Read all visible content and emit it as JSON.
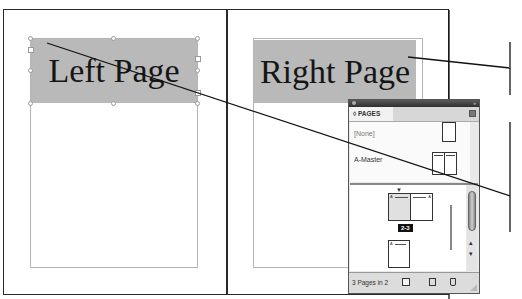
{
  "document": {
    "left_page": {
      "text_frame_label": "Left Page"
    },
    "right_page": {
      "text_frame_label": "Right Page"
    }
  },
  "pages_panel": {
    "tab_label": "◊ PAGES",
    "menu_icon": "panel-menu-icon",
    "masters": [
      {
        "label": "[None]"
      },
      {
        "label": "A-Master"
      }
    ],
    "spread_badge": "2-3",
    "footer": {
      "status": "3 Pages in 2",
      "buttons": [
        "new-page-icon",
        "new-master-icon",
        "trash-icon"
      ]
    },
    "scroll": {
      "up": "▴",
      "down": "▾"
    }
  },
  "colors": {
    "frame_fill": "#b9b9b9",
    "panel_bg": "#e9e9e9",
    "titlebar": "#3a3a3a",
    "badge_bg": "#111111"
  }
}
